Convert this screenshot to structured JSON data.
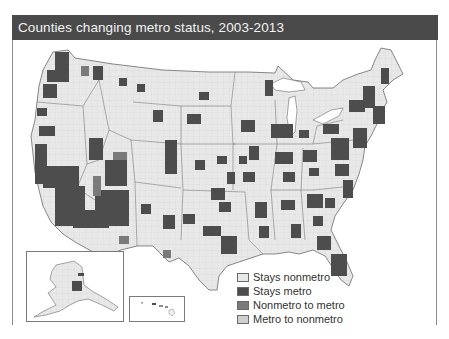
{
  "header": {
    "title": "Counties changing metro status, 2003-2013"
  },
  "map": {
    "type": "choropleth",
    "region": "United States (counties)",
    "insets": [
      "Alaska",
      "Hawaii"
    ]
  },
  "legend": {
    "items": [
      {
        "label": "Stays nonmetro",
        "color": "#e8e8e8"
      },
      {
        "label": "Stays metro",
        "color": "#4d4d4d"
      },
      {
        "label": "Nonmetro to metro",
        "color": "#7a7a7a"
      },
      {
        "label": "Metro to nonmetro",
        "color": "#cfcfcf"
      }
    ]
  },
  "colors": {
    "title_bar": "#4a4a4a",
    "title_text": "#f2f2f2",
    "land": "#e8e8e8",
    "metro": "#4d4d4d",
    "nonmetro_to_metro": "#7a7a7a",
    "borders": "#8a8a8a"
  }
}
